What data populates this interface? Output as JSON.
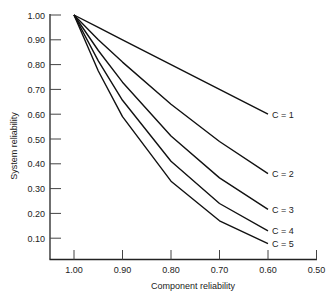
{
  "chart_data": {
    "type": "line",
    "title": "",
    "xlabel": "Component reliability",
    "ylabel": "System reliability",
    "x": [
      1.0,
      0.95,
      0.9,
      0.8,
      0.7,
      0.6
    ],
    "xlim": [
      1.05,
      0.5
    ],
    "ylim": [
      0.0,
      1.0
    ],
    "x_ticks": [
      "1.00",
      "0.90",
      "0.80",
      "0.70",
      "0.60",
      "0.50"
    ],
    "y_ticks": [
      "1.00",
      "0.90",
      "0.80",
      "0.70",
      "0.60",
      "0.50",
      "0.40",
      "0.30",
      "0.20",
      "0.10"
    ],
    "grid": false,
    "legend": "inline labels at line ends",
    "series": [
      {
        "name": "C = 1",
        "values": [
          1.0,
          0.95,
          0.9,
          0.8,
          0.7,
          0.6
        ]
      },
      {
        "name": "C = 2",
        "values": [
          1.0,
          0.9,
          0.81,
          0.64,
          0.49,
          0.36
        ]
      },
      {
        "name": "C = 3",
        "values": [
          1.0,
          0.857,
          0.729,
          0.512,
          0.343,
          0.216
        ]
      },
      {
        "name": "C = 4",
        "values": [
          1.0,
          0.815,
          0.656,
          0.41,
          0.24,
          0.13
        ]
      },
      {
        "name": "C = 5",
        "values": [
          1.0,
          0.774,
          0.59,
          0.33,
          0.17,
          0.078
        ]
      }
    ]
  }
}
